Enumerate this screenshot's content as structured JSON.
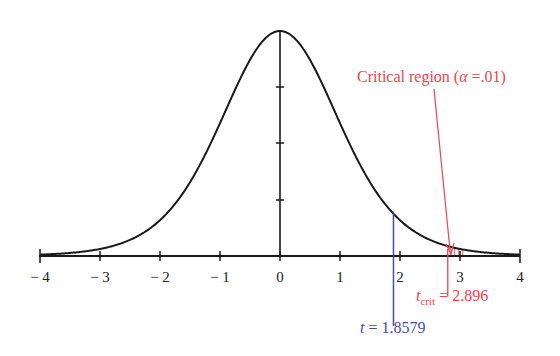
{
  "chart_data": {
    "type": "line",
    "title": "",
    "xlabel": "",
    "ylabel": "",
    "xlim": [
      -4,
      4
    ],
    "x_ticks": [
      -4,
      -3,
      -2,
      -1,
      0,
      1,
      2,
      3,
      4
    ],
    "x_tick_labels": [
      "− 4",
      "− 3",
      "− 2",
      "− 1",
      "0",
      "1",
      "2",
      "3",
      "4"
    ],
    "y_ticks_count": 3,
    "grid": false,
    "legend": null,
    "curve": {
      "distribution": "student-t",
      "df": 9,
      "color": "#1a1a1a"
    },
    "observed_t": {
      "value": 1.8579,
      "label_var": "t",
      "label_value": "= 1.8579",
      "color": "#4a4aa8"
    },
    "critical_value": {
      "value": 2.896,
      "label_var": "t",
      "label_sub": "crit",
      "label_value": "= 2.896",
      "color": "#e8454e"
    },
    "annotations": [
      {
        "text": "Critical region (",
        "alpha_symbol": "α",
        "text_end": " =.01)",
        "color": "#e8454e"
      }
    ]
  },
  "labels": {
    "critical_region_prefix": "Critical region (",
    "alpha": "α",
    "critical_region_suffix": " =.01)",
    "tcrit_var": "t",
    "tcrit_sub": "crit",
    "tcrit_value": " = 2.896",
    "t_var": "t",
    "t_value": " = 1.8579",
    "ticks": [
      "− 4",
      "− 3",
      "− 2",
      "− 1",
      "0",
      "1",
      "2",
      "3",
      "4"
    ]
  }
}
